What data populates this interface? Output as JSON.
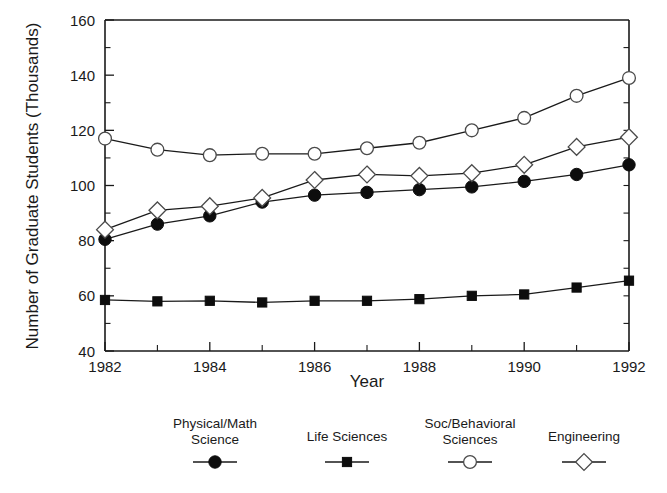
{
  "chart_data": {
    "type": "line",
    "title": "",
    "xlabel": "Year",
    "ylabel": "Number of Graduate Students (Thousands)",
    "x": [
      1982,
      1983,
      1984,
      1985,
      1986,
      1987,
      1988,
      1989,
      1990,
      1991,
      1992
    ],
    "xlim": [
      1982,
      1992
    ],
    "ylim": [
      40,
      160
    ],
    "xticks": [
      1982,
      1984,
      1986,
      1988,
      1990,
      1992
    ],
    "xtick_labels": [
      "1982",
      "1984",
      "1986",
      "1988",
      "1990",
      "1992"
    ],
    "xticks_minor": [
      1983,
      1985,
      1987,
      1989,
      1991
    ],
    "yticks": [
      40,
      60,
      80,
      100,
      120,
      140,
      160
    ],
    "ytick_labels": [
      "40",
      "60",
      "80",
      "100",
      "120",
      "140",
      "160"
    ],
    "yticks_minor": [
      50,
      70,
      90,
      110,
      130,
      150
    ],
    "grid": false,
    "legend_position": "bottom",
    "series": [
      {
        "name": "Physical/Math Science",
        "marker": "filled-circle",
        "values": [
          80.5,
          86.0,
          89.0,
          94.0,
          96.5,
          97.5,
          98.5,
          99.5,
          101.5,
          104.0,
          107.5
        ]
      },
      {
        "name": "Life Sciences",
        "marker": "filled-square",
        "values": [
          58.5,
          58.0,
          58.2,
          57.6,
          58.2,
          58.2,
          58.8,
          60.0,
          60.5,
          63.0,
          65.5
        ]
      },
      {
        "name": "Soc/Behavioral Sciences",
        "marker": "open-circle",
        "values": [
          117.0,
          113.0,
          111.0,
          111.5,
          111.5,
          113.5,
          115.5,
          120.0,
          124.5,
          132.5,
          139.0
        ]
      },
      {
        "name": "Engineering",
        "marker": "open-diamond",
        "values": [
          84.0,
          91.0,
          92.5,
          95.5,
          102.0,
          104.0,
          103.5,
          104.5,
          107.5,
          114.0,
          117.5
        ]
      }
    ]
  },
  "legend": {
    "entries": [
      {
        "label_line1": "Physical/Math",
        "label_line2": "Science",
        "marker": "filled-circle"
      },
      {
        "label_line1": "Life Sciences",
        "label_line2": "",
        "marker": "filled-square"
      },
      {
        "label_line1": "Soc/Behavioral",
        "label_line2": "Sciences",
        "marker": "open-circle"
      },
      {
        "label_line1": "Engineering",
        "label_line2": "",
        "marker": "open-diamond"
      }
    ]
  },
  "colors": {
    "axis": "#1a1a1a",
    "line": "#1a1a1a",
    "marker_fill": "#0d0d0d",
    "marker_open": "#ffffff",
    "background": "#ffffff"
  }
}
